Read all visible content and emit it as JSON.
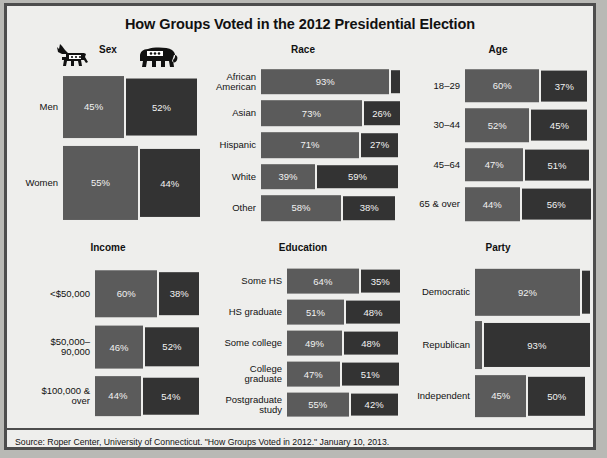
{
  "title": "How Groups Voted in the 2012 Presidential Election",
  "source": "Source: Roper Center, University of Connecticut. \"How Groups Voted in 2012.\" January 10, 2013.",
  "icons": {
    "democrat": "donkey-icon",
    "republican": "elephant-icon"
  },
  "colors": {
    "democrat": "#5b5b5b",
    "republican": "#333333",
    "background": "#eeeeec",
    "border": "#4d4d4d",
    "text": "#111111",
    "bar_text": "#f2f2f2"
  },
  "chart_data": {
    "type": "bar",
    "title": "How Groups Voted in the 2012 Presidential Election",
    "xlabel": "",
    "ylabel": "",
    "legend": [
      "Democratic (Obama)",
      "Republican (Romney)"
    ],
    "legend_position": "top-left icons (donkey / elephant)",
    "grid": false,
    "unit": "percent",
    "panels": [
      {
        "name": "Sex",
        "categories": [
          "Men",
          "Women"
        ],
        "series": [
          {
            "name": "Democratic",
            "values": [
              45,
              55
            ]
          },
          {
            "name": "Republican",
            "values": [
              52,
              44
            ]
          }
        ],
        "labels": [
          [
            "45%",
            "52%"
          ],
          [
            "55%",
            "44%"
          ]
        ],
        "row_weights": [
          0.46,
          0.54
        ]
      },
      {
        "name": "Race",
        "categories": [
          "African\nAmerican",
          "Asian",
          "Hispanic",
          "White",
          "Other"
        ],
        "series": [
          {
            "name": "Democratic",
            "values": [
              93,
              73,
              71,
              39,
              58
            ]
          },
          {
            "name": "Republican",
            "values": [
              6,
              26,
              27,
              59,
              38
            ]
          }
        ],
        "labels": [
          [
            "93%",
            ""
          ],
          [
            "73%",
            "26%"
          ],
          [
            "71%",
            "27%"
          ],
          [
            "39%",
            "59%"
          ],
          [
            "58%",
            "38%"
          ]
        ],
        "row_weights": [
          0.2,
          0.2,
          0.2,
          0.2,
          0.2
        ]
      },
      {
        "name": "Age",
        "categories": [
          "18–29",
          "30–44",
          "45–64",
          "65 & over"
        ],
        "series": [
          {
            "name": "Democratic",
            "values": [
              60,
              52,
              47,
              44
            ]
          },
          {
            "name": "Republican",
            "values": [
              37,
              45,
              51,
              56
            ]
          }
        ],
        "labels": [
          [
            "60%",
            "37%"
          ],
          [
            "52%",
            "45%"
          ],
          [
            "47%",
            "51%"
          ],
          [
            "44%",
            "56%"
          ]
        ],
        "row_weights": [
          0.25,
          0.25,
          0.25,
          0.25
        ]
      },
      {
        "name": "Income",
        "categories": [
          "<$50,000",
          "$50,000–\n90,000",
          "$100,000 &\nover"
        ],
        "series": [
          {
            "name": "Democratic",
            "values": [
              60,
              46,
              44
            ]
          },
          {
            "name": "Republican",
            "values": [
              38,
              52,
              54
            ]
          }
        ],
        "labels": [
          [
            "60%",
            "38%"
          ],
          [
            "46%",
            "52%"
          ],
          [
            "44%",
            "54%"
          ]
        ],
        "row_weights": [
          0.36,
          0.33,
          0.31
        ]
      },
      {
        "name": "Education",
        "categories": [
          "Some HS",
          "HS graduate",
          "Some college",
          "College\ngraduate",
          "Postgraduate\nstudy"
        ],
        "series": [
          {
            "name": "Democratic",
            "values": [
              64,
              51,
              49,
              47,
              55
            ]
          },
          {
            "name": "Republican",
            "values": [
              35,
              48,
              48,
              51,
              42
            ]
          }
        ],
        "labels": [
          [
            "64%",
            "35%"
          ],
          [
            "51%",
            "48%"
          ],
          [
            "49%",
            "48%"
          ],
          [
            "47%",
            "51%"
          ],
          [
            "55%",
            "42%"
          ]
        ],
        "row_weights": [
          0.2,
          0.2,
          0.2,
          0.2,
          0.2
        ]
      },
      {
        "name": "Party",
        "categories": [
          "Democratic",
          "Republican",
          "Independent"
        ],
        "series": [
          {
            "name": "Democratic",
            "values": [
              92,
              6,
              45
            ]
          },
          {
            "name": "Republican",
            "values": [
              7,
              93,
              50
            ]
          }
        ],
        "labels": [
          [
            "92%",
            ""
          ],
          [
            "",
            "93%"
          ],
          [
            "45%",
            "50%"
          ]
        ],
        "row_weights": [
          0.34,
          0.35,
          0.31
        ]
      }
    ]
  }
}
